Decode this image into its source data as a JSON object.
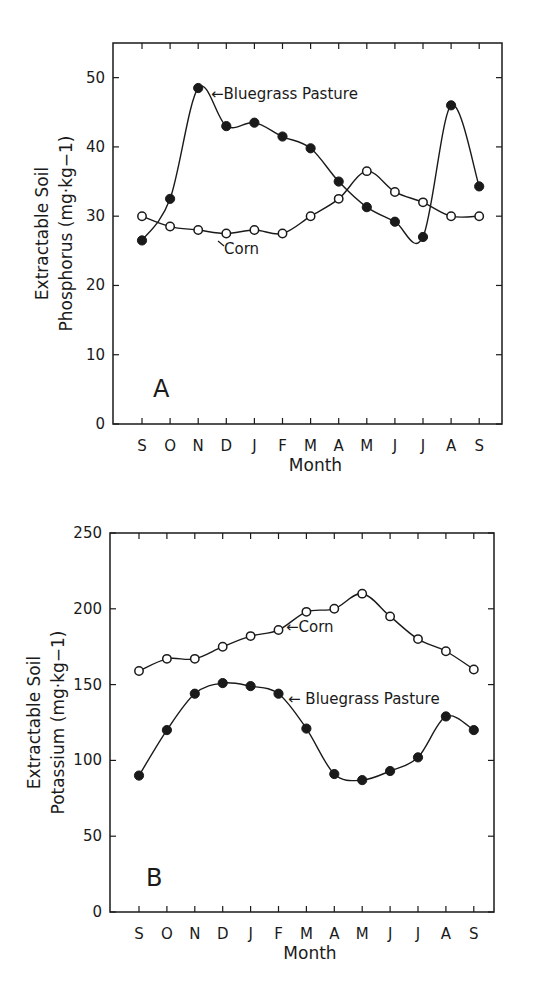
{
  "chart_data": [
    {
      "type": "line",
      "panel": "A",
      "title": "",
      "xlabel": "Month",
      "ylabel": [
        "Extractable Soil",
        "Phosphorus (mg·kg−1)"
      ],
      "categories": [
        "S",
        "O",
        "N",
        "D",
        "J",
        "F",
        "M",
        "A",
        "M",
        "J",
        "J",
        "A",
        "S"
      ],
      "ylim": [
        0,
        55
      ],
      "yticks": [
        0,
        10,
        20,
        30,
        40,
        50
      ],
      "grid": false,
      "series": [
        {
          "name": "Bluegrass Pasture",
          "marker": "filled-circle",
          "values": [
            26.5,
            32.5,
            48.5,
            43.0,
            43.5,
            41.5,
            39.8,
            35.0,
            31.3,
            29.2,
            27.0,
            46.0,
            34.3
          ]
        },
        {
          "name": "Corn",
          "marker": "open-circle",
          "values": [
            30.0,
            28.5,
            28.0,
            27.5,
            28.0,
            27.5,
            30.0,
            32.5,
            36.5,
            33.5,
            32.0,
            30.0,
            30.0
          ]
        }
      ],
      "annotations": [
        {
          "text": "←Bluegrass Pasture",
          "near": "N peak"
        },
        {
          "text": "Corn",
          "near": "D corn point"
        }
      ]
    },
    {
      "type": "line",
      "panel": "B",
      "title": "",
      "xlabel": "Month",
      "ylabel": [
        "Extractable Soil",
        "Potassium (mg·kg−1)"
      ],
      "categories": [
        "S",
        "O",
        "N",
        "D",
        "J",
        "F",
        "M",
        "A",
        "M",
        "J",
        "J",
        "A",
        "S"
      ],
      "ylim": [
        0,
        250
      ],
      "yticks": [
        0,
        50,
        100,
        150,
        200,
        250
      ],
      "grid": false,
      "series": [
        {
          "name": "Bluegrass Pasture",
          "marker": "filled-circle",
          "values": [
            90,
            120,
            144,
            151,
            149,
            144,
            121,
            91,
            87,
            93,
            102,
            129,
            120
          ]
        },
        {
          "name": "Corn",
          "marker": "open-circle",
          "values": [
            159,
            167,
            167,
            175,
            182,
            186,
            198,
            200,
            210,
            195,
            180,
            172,
            160
          ]
        }
      ],
      "annotations": [
        {
          "text": "← Corn",
          "near": "F corn point"
        },
        {
          "text": "← Bluegrass Pasture",
          "near": "F bluegrass point"
        }
      ]
    }
  ],
  "panels": {
    "a": {
      "letter": "A",
      "ylabel_line1": "Extractable Soil",
      "ylabel_line2": "Phosphorus (mg·kg−1)",
      "xlabel": "Month",
      "annot_bluegrass": "←Bluegrass Pasture",
      "annot_corn": "Corn"
    },
    "b": {
      "letter": "B",
      "ylabel_line1": "Extractable Soil",
      "ylabel_line2": "Potassium (mg·kg−1)",
      "xlabel": "Month",
      "annot_bluegrass": "← Bluegrass Pasture",
      "annot_corn": "←Corn"
    }
  }
}
